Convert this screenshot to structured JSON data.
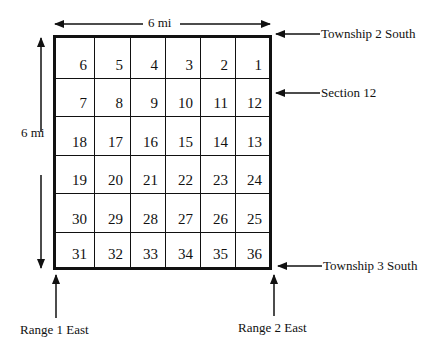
{
  "dimensions": {
    "top_label": "6 mi",
    "left_label": "6 mi"
  },
  "annotations": {
    "township_top": "Township 2 South",
    "section": "Section 12",
    "township_bottom": "Township 3 South",
    "range_left": "Range 1 East",
    "range_right": "Range 2 East"
  },
  "grid": {
    "rows": [
      [
        "6",
        "5",
        "4",
        "3",
        "2",
        "1"
      ],
      [
        "7",
        "8",
        "9",
        "10",
        "11",
        "12"
      ],
      [
        "18",
        "17",
        "16",
        "15",
        "14",
        "13"
      ],
      [
        "19",
        "20",
        "21",
        "22",
        "23",
        "24"
      ],
      [
        "30",
        "29",
        "28",
        "27",
        "26",
        "25"
      ],
      [
        "31",
        "32",
        "33",
        "34",
        "35",
        "36"
      ]
    ]
  }
}
